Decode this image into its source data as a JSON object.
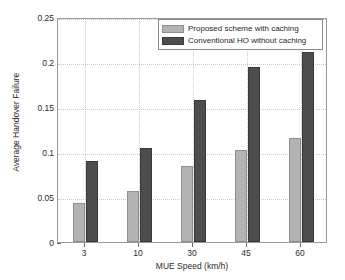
{
  "chart_data": {
    "type": "bar",
    "title": "",
    "xlabel": "MUE Speed (km/h)",
    "ylabel": "Average Handover Failure",
    "categories": [
      "3",
      "10",
      "30",
      "45",
      "60"
    ],
    "series": [
      {
        "name": "Proposed scheme with caching",
        "color": "#b3b3b3",
        "values": [
          0.043,
          0.057,
          0.084,
          0.102,
          0.116
        ]
      },
      {
        "name": "Conventional HO without caching",
        "color": "#4d4d4d",
        "values": [
          0.09,
          0.105,
          0.158,
          0.195,
          0.211
        ]
      }
    ],
    "ylim": [
      0,
      0.25
    ],
    "yticks": [
      0,
      0.05,
      0.1,
      0.15,
      0.2,
      0.25
    ],
    "ytick_labels": [
      "0",
      "0.05",
      "0.1",
      "0.15",
      "0.2",
      "0.25"
    ],
    "grid": true,
    "legend_position": "top-right"
  }
}
